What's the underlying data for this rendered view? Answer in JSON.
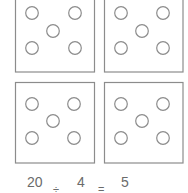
{
  "diagram": {
    "type": "division-grouping",
    "stroke_color": "#8c8c8c",
    "text_color": "#6b6b6b",
    "groups": [
      {
        "position": "top-left",
        "dots": 5
      },
      {
        "position": "top-right",
        "dots": 5
      },
      {
        "position": "bottom-left",
        "dots": 5
      },
      {
        "position": "bottom-right",
        "dots": 5
      }
    ]
  },
  "equation": {
    "dividend": "20",
    "divide_sign": "÷",
    "divisor": "4",
    "equals_sign": "=",
    "quotient": "5"
  }
}
